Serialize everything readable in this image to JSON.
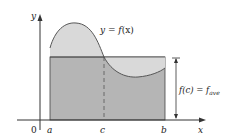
{
  "figure": {
    "axis_labels": {
      "y": "y",
      "x": "x",
      "origin": "0"
    },
    "points": {
      "a": "a",
      "b": "b",
      "c": "c"
    },
    "curve_label": {
      "lhs": "y = ",
      "fn": "f",
      "arg": "(x)"
    },
    "bracket_label": {
      "fc": "f(c) = f",
      "sub": "ave"
    },
    "colors": {
      "rect_fill": "#b8b8b8",
      "area_fill": "#d6d6d6",
      "curve_stroke": "#555555",
      "axis": "#333333"
    }
  }
}
